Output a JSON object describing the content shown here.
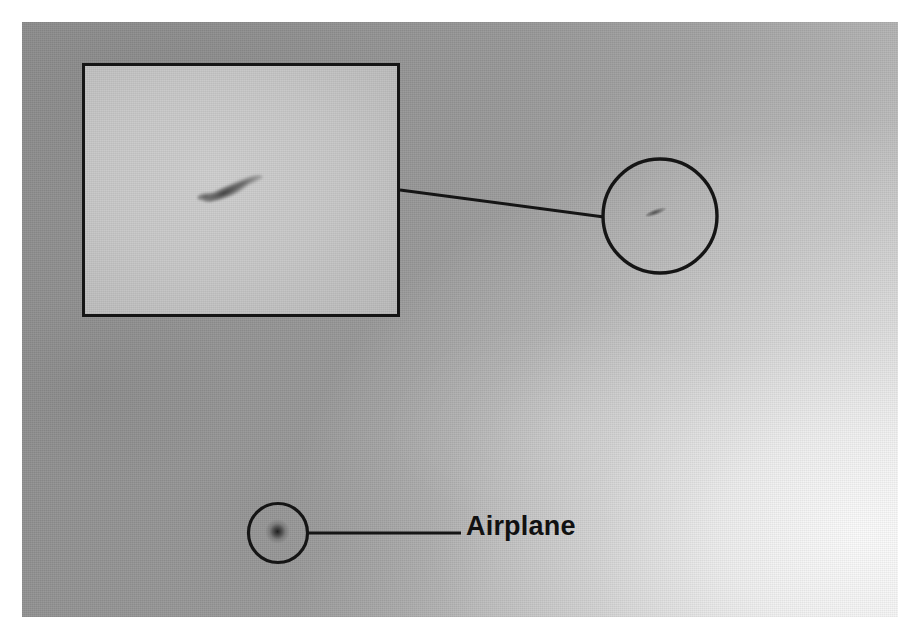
{
  "figure": {
    "kind": "annotated-photograph",
    "subject": "Airplane",
    "background_description": "Overcast gray sky gradient",
    "canvas": {
      "width": 915,
      "height": 635
    },
    "photo_bounds": {
      "x": 22,
      "y": 22,
      "width": 876,
      "height": 595
    },
    "colors": {
      "border_white": "#ffffff",
      "sky_dark": "#8d8d8d",
      "sky_mid": "#a3a3a3",
      "sky_light": "#d9d9d9",
      "inset_fill": "#c7c7c7",
      "annotation_stroke": "#151515",
      "label_text": "#111111"
    }
  },
  "annotations": {
    "label": {
      "text": "Airplane",
      "font_size_px": 27,
      "weight": "bold",
      "x": 466,
      "y": 513
    },
    "inset": {
      "name": "magnified-view",
      "x": 82,
      "y": 63,
      "width": 318,
      "height": 254,
      "stroke_width": 3,
      "content": "magnified airplane streak"
    },
    "detector_circles": [
      {
        "name": "upper-detection-circle",
        "cx": 660,
        "cy": 216,
        "r": 58,
        "stroke_width": 3,
        "content": "small dark airplane streak"
      },
      {
        "name": "lower-detection-circle",
        "cx": 278,
        "cy": 533,
        "r": 30,
        "stroke_width": 3,
        "content": "small dark airplane blob"
      }
    ],
    "leader_lines": [
      {
        "name": "inset-to-upper-circle-connector",
        "x1": 400,
        "y1": 190,
        "x2": 604,
        "y2": 217,
        "stroke_width": 3
      },
      {
        "name": "lower-circle-to-label-connector",
        "x1": 308,
        "y1": 533,
        "x2": 460,
        "y2": 533,
        "stroke_width": 3
      }
    ]
  }
}
